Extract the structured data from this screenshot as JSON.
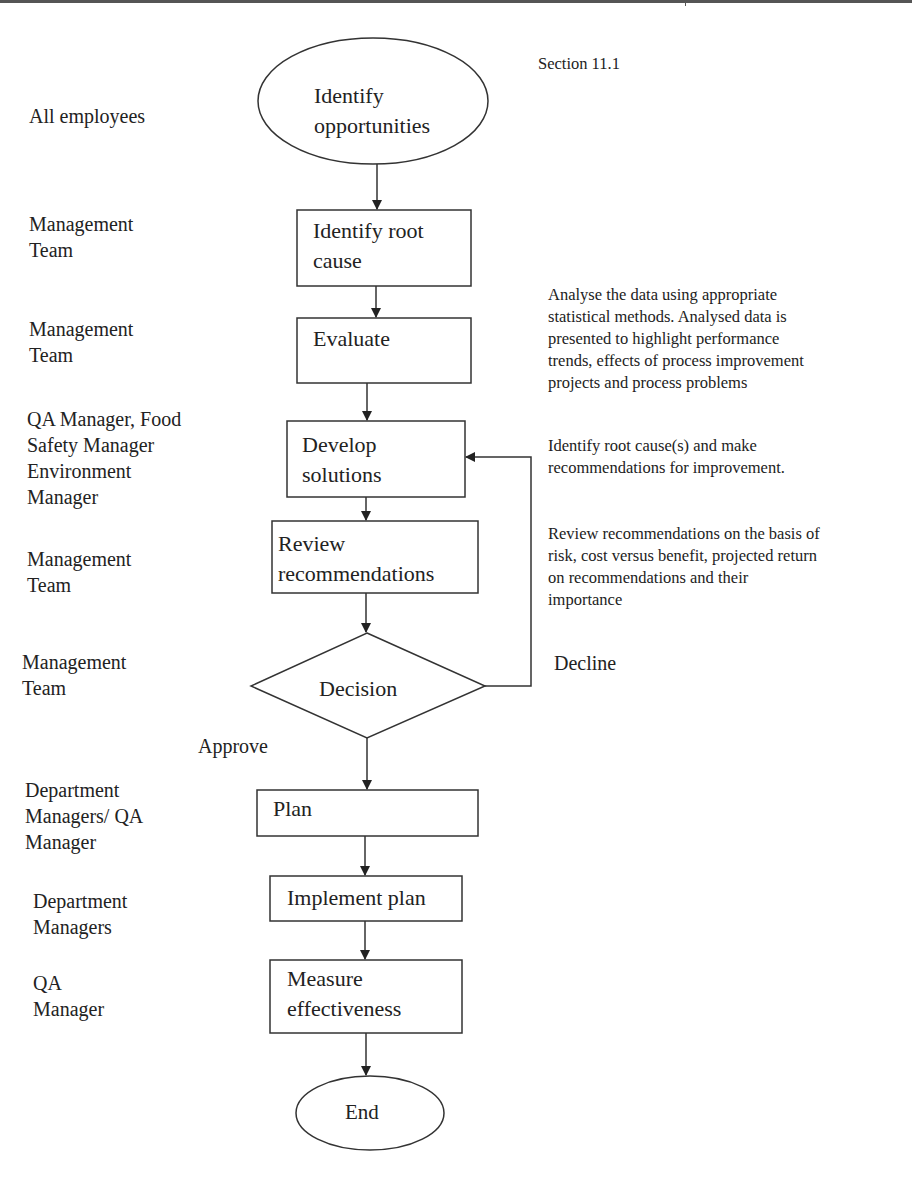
{
  "section_ref": "Section 11.1",
  "roles": [
    {
      "id": "r1",
      "text": "All employees"
    },
    {
      "id": "r2",
      "text": "Management\nTeam"
    },
    {
      "id": "r3",
      "text": "Management\nTeam"
    },
    {
      "id": "r4",
      "text": "QA Manager, Food\nSafety Manager\nEnvironment\nManager"
    },
    {
      "id": "r5",
      "text": "Management\nTeam"
    },
    {
      "id": "r6",
      "text": "Management\nTeam"
    },
    {
      "id": "r7",
      "text": "Department\nManagers/ QA\nManager"
    },
    {
      "id": "r8",
      "text": "Department\nManagers"
    },
    {
      "id": "r9",
      "text": "QA\nManager"
    }
  ],
  "nodes": [
    {
      "id": "n1",
      "shape": "ellipse",
      "text": "Identify\nopportunities"
    },
    {
      "id": "n2",
      "shape": "box",
      "text": "Identify root\ncause"
    },
    {
      "id": "n3",
      "shape": "box",
      "text": "Evaluate"
    },
    {
      "id": "n4",
      "shape": "box",
      "text": "Develop\nsolutions"
    },
    {
      "id": "n5",
      "shape": "box",
      "text": "Review\nrecommendations"
    },
    {
      "id": "n6",
      "shape": "diamond",
      "text": "Decision"
    },
    {
      "id": "n7",
      "shape": "box",
      "text": "Plan"
    },
    {
      "id": "n8",
      "shape": "box",
      "text": "Implement plan"
    },
    {
      "id": "n9",
      "shape": "box",
      "text": "Measure\neffectiveness"
    },
    {
      "id": "n10",
      "shape": "ellipse",
      "text": "End"
    }
  ],
  "edges": [
    {
      "from": "n1",
      "to": "n2",
      "label": ""
    },
    {
      "from": "n2",
      "to": "n3",
      "label": ""
    },
    {
      "from": "n3",
      "to": "n4",
      "label": ""
    },
    {
      "from": "n4",
      "to": "n5",
      "label": ""
    },
    {
      "from": "n5",
      "to": "n6",
      "label": ""
    },
    {
      "from": "n6",
      "to": "n7",
      "label": "Approve"
    },
    {
      "from": "n6",
      "to": "n4",
      "label": "Decline"
    },
    {
      "from": "n7",
      "to": "n8",
      "label": ""
    },
    {
      "from": "n8",
      "to": "n9",
      "label": ""
    },
    {
      "from": "n9",
      "to": "n10",
      "label": ""
    }
  ],
  "notes": [
    {
      "id": "note1",
      "text": "Analyse the data using appropriate\nstatistical methods. Analysed data is\npresented to highlight performance\ntrends, effects of process improvement\nprojects and process problems"
    },
    {
      "id": "note2",
      "text": "Identify root cause(s) and make\nrecommendations for improvement."
    },
    {
      "id": "note3",
      "text": "Review recommendations on the basis of\nrisk, cost versus benefit, projected return\non recommendations and their\nimportance"
    }
  ],
  "edge_labels": {
    "approve": "Approve",
    "decline": "Decline"
  },
  "colors": {
    "stroke": "#333333",
    "text": "#222222",
    "background": "#ffffff"
  }
}
